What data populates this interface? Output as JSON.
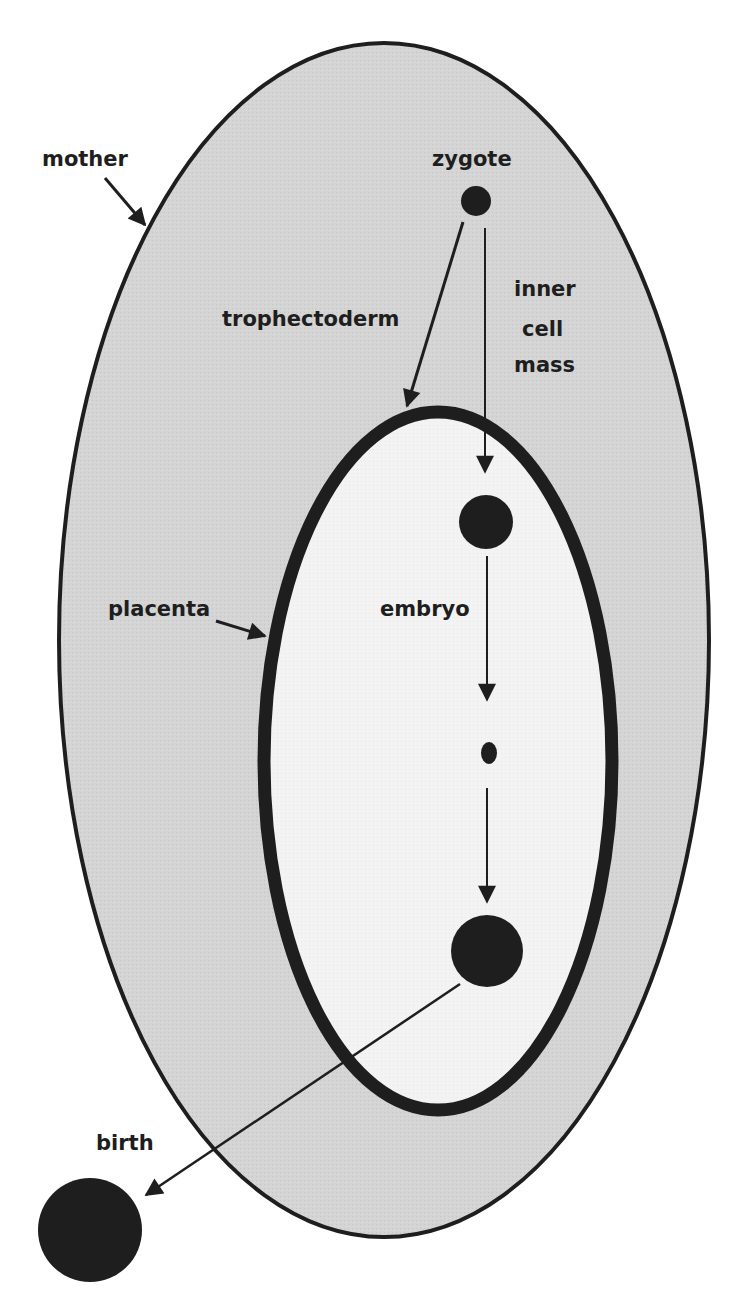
{
  "diagram": {
    "title": "",
    "colors": {
      "mother_fill": "#d4d4d4",
      "placenta_interior_fill": "#f4f4f4",
      "stroke": "#1e1e1e",
      "background": "#ffffff"
    },
    "labels": {
      "mother": "mother",
      "zygote": "zygote",
      "trophectoderm": "trophectoderm",
      "inner_cell_mass_line1": "inner",
      "inner_cell_mass_line2": "cell",
      "inner_cell_mass_line3": "mass",
      "placenta": "placenta",
      "embryo": "embryo",
      "birth": "birth"
    },
    "nodes": [
      {
        "id": "zygote",
        "label": "zygote",
        "region": "mother"
      },
      {
        "id": "inner-cell-mass",
        "label": "inner cell mass",
        "region": "placenta"
      },
      {
        "id": "embryo-small",
        "label": "",
        "region": "placenta"
      },
      {
        "id": "embryo-large",
        "label": "",
        "region": "placenta"
      },
      {
        "id": "birth",
        "label": "birth",
        "region": "outside"
      }
    ],
    "edges": [
      {
        "from": "zygote",
        "to": "placenta",
        "label": "trophectoderm"
      },
      {
        "from": "zygote",
        "to": "inner-cell-mass",
        "label": "inner cell mass"
      },
      {
        "from": "inner-cell-mass",
        "to": "embryo-small",
        "label": "embryo"
      },
      {
        "from": "embryo-small",
        "to": "embryo-large",
        "label": ""
      },
      {
        "from": "embryo-large",
        "to": "birth",
        "label": "birth"
      }
    ],
    "regions": [
      {
        "id": "mother",
        "label": "mother",
        "shape": "ellipse"
      },
      {
        "id": "placenta",
        "label": "placenta",
        "shape": "ellipse"
      }
    ]
  }
}
